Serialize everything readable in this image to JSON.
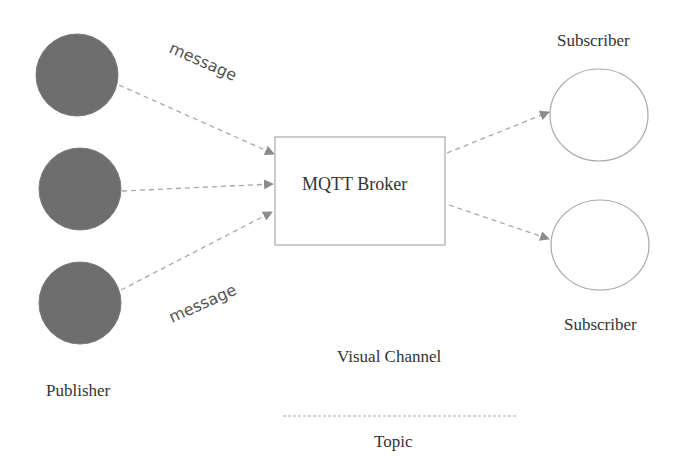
{
  "diagram": {
    "broker": {
      "label": "MQTT Broker"
    },
    "publishers": {
      "label": "Publisher",
      "nodes": [
        {
          "id": "publisher-1"
        },
        {
          "id": "publisher-2"
        },
        {
          "id": "publisher-3"
        }
      ],
      "fill": "#6e6e6e"
    },
    "subscribers": {
      "top_label": "Subscriber",
      "bottom_label": "Subscriber",
      "stroke": "#aaaaaa"
    },
    "edge_labels": {
      "top": "message",
      "bottom": "message"
    },
    "legend": {
      "channel_label": "Visual Channel",
      "topic_label": "Topic"
    },
    "colors": {
      "arrow": "#9a9a9a",
      "dashed_line": "#b0b0b0",
      "box_border": "#aaaaaa"
    }
  }
}
